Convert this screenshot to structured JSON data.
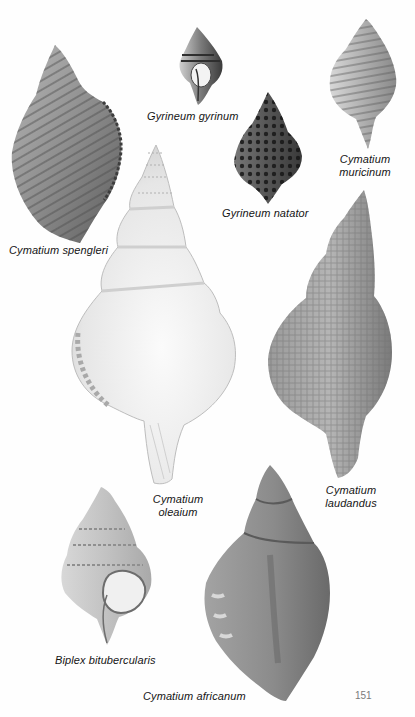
{
  "page": {
    "type": "illustrated plate",
    "page_number": "151"
  },
  "plates": [
    {
      "id": "cymatium-spengleri",
      "caption": "Cymatium spengleri",
      "caption_lines": [
        "Cymatium spengleri"
      ]
    },
    {
      "id": "gyrineum-gyrinum",
      "caption": "Gyrineum gyrinum",
      "caption_lines": [
        "Gyrineum gyrinum"
      ]
    },
    {
      "id": "cymatium-muricinum",
      "caption": "Cymatium muricinum",
      "caption_lines": [
        "Cymatium",
        "muricinum"
      ]
    },
    {
      "id": "gyrineum-natator",
      "caption": "Gyrineum natator",
      "caption_lines": [
        "Gyrineum natator"
      ]
    },
    {
      "id": "cymatium-oleaium",
      "caption": "Cymatium oleaium",
      "caption_lines": [
        "Cymatium",
        "oleaium"
      ]
    },
    {
      "id": "cymatium-laudandus",
      "caption": "Cymatium laudandus",
      "caption_lines": [
        "Cymatium",
        "laudandus"
      ]
    },
    {
      "id": "biplex-bitubercularis",
      "caption": "Biplex bitubercularis",
      "caption_lines": [
        "Biplex bitubercularis"
      ]
    },
    {
      "id": "cymatium-africanum",
      "caption": "Cymatium africanum",
      "caption_lines": [
        "Cymatium africanum"
      ]
    }
  ],
  "colors": {
    "paper": "#fefefe",
    "ink": "#151515",
    "page_number": "#7a7a7a"
  }
}
